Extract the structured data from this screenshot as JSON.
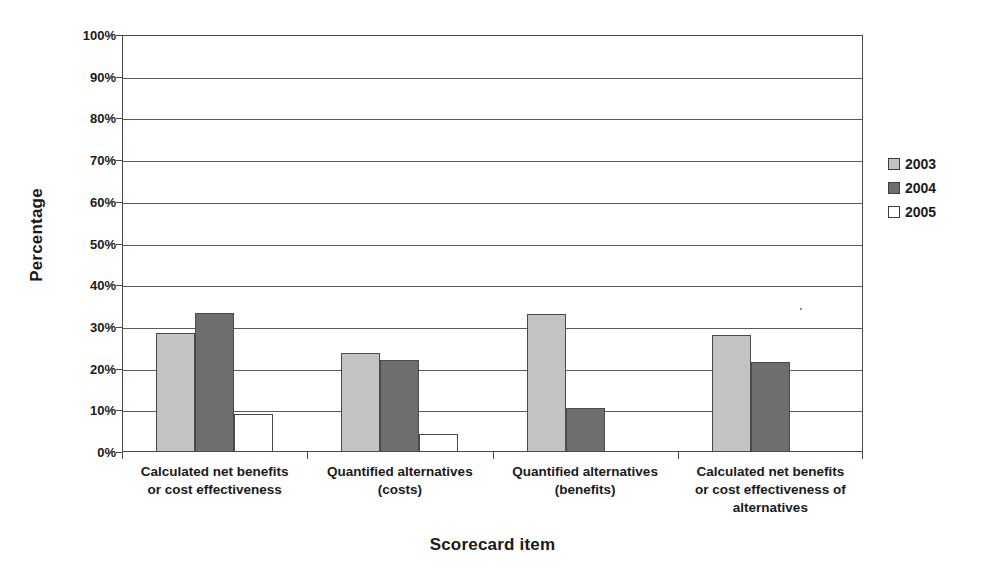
{
  "chart_data": {
    "type": "bar",
    "title": "",
    "xlabel": "Scorecard item",
    "ylabel": "Percentage",
    "ylim": [
      0,
      100
    ],
    "ytick_labels": [
      "0%",
      "10%",
      "20%",
      "30%",
      "40%",
      "50%",
      "60%",
      "70%",
      "80%",
      "90%",
      "100%"
    ],
    "ytick_values": [
      0,
      10,
      20,
      30,
      40,
      50,
      60,
      70,
      80,
      90,
      100
    ],
    "grid": "horizontal",
    "legend_position": "right",
    "categories": [
      "Calculated net benefits or cost effectiveness",
      "Quantified alternatives (costs)",
      "Quantified alternatives (benefits)",
      "Calculated net benefits or cost effectiveness of alternatives"
    ],
    "category_lines": [
      [
        "Calculated net benefits",
        "or cost effectiveness"
      ],
      [
        "Quantified alternatives",
        "(costs)"
      ],
      [
        "Quantified alternatives",
        "(benefits)"
      ],
      [
        "Calculated net benefits",
        "or cost effectiveness of",
        "alternatives"
      ]
    ],
    "series": [
      {
        "name": "2003",
        "color": "#c3c3c3",
        "values": [
          28.6,
          23.8,
          33.0,
          28.0
        ]
      },
      {
        "name": "2004",
        "color": "#6e6e6e",
        "values": [
          33.4,
          22.0,
          10.6,
          21.6
        ]
      },
      {
        "name": "2005",
        "color": "#ffffff",
        "values": [
          9.0,
          4.3,
          0,
          0
        ]
      }
    ]
  },
  "legend": {
    "items": [
      {
        "label": "2003",
        "color": "#c3c3c3"
      },
      {
        "label": "2004",
        "color": "#6e6e6e"
      },
      {
        "label": "2005",
        "color": "#ffffff"
      }
    ]
  },
  "axes": {
    "x_title": "Scorecard item",
    "y_title": "Percentage"
  },
  "colors": {
    "series_2003": "#c3c3c3",
    "series_2004": "#6e6e6e",
    "series_2005": "#ffffff",
    "axis": "#4a4a4a",
    "gridline": "#5a5a5a",
    "text": "#1a1a1a",
    "background": "#ffffff"
  }
}
